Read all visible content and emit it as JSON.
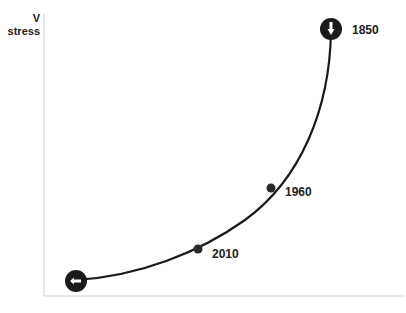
{
  "diagram": {
    "y_axis": {
      "symbol": "V",
      "label": "stress"
    },
    "curve": {
      "color": "#1a1a1a",
      "start_marker": {
        "icon": "arrow-left-icon"
      },
      "end_marker": {
        "icon": "arrow-down-icon"
      },
      "points": [
        {
          "label": "2010"
        },
        {
          "label": "1960"
        },
        {
          "label": "1850"
        }
      ]
    }
  }
}
